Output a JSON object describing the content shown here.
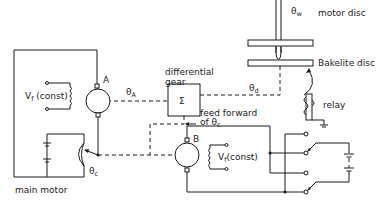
{
  "diagram": {
    "type": "servo control schematic",
    "labels": {
      "theta_w": "θ",
      "theta_w_sub": "w",
      "motor_disc": "motor disc",
      "bakelite_disc": "Bakelite disc",
      "differential_gear_line1": "differential",
      "differential_gear_line2": "gear",
      "sigma": "Σ",
      "motor_a": "A",
      "motor_b": "B",
      "theta_a": "θ",
      "theta_a_sub": "A",
      "theta_d": "θ",
      "theta_d_sub": "d",
      "vf_const_a": "V",
      "vf_const_a_sub": "f",
      "vf_const_a_tail": " (const)",
      "vf_const_b": "V",
      "vf_const_b_sub": "f",
      "vf_const_b_tail": "(const)",
      "feed_forward_line1": "feed forward",
      "feed_forward_line2": "of θ",
      "feed_forward_sub": "c",
      "theta_c": "θ",
      "theta_c_sub": "c",
      "relay": "relay",
      "main_motor": "main motor"
    },
    "components": [
      "motor disc",
      "Bakelite disc",
      "differential gear",
      "generator A",
      "motor B",
      "main motor",
      "relay",
      "reversing switch",
      "battery"
    ]
  }
}
